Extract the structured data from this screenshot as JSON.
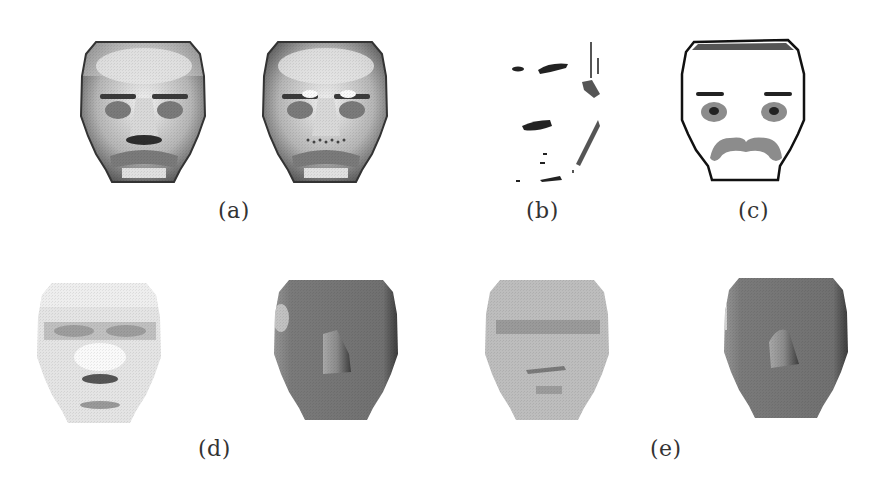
{
  "figure": {
    "panels": [
      {
        "id": "a",
        "label": "(a)",
        "description": "Two shaded face renderings; right one has bright spots over eyes and dotted nostril region"
      },
      {
        "id": "b",
        "label": "(b)",
        "description": "Sparse dark edge marks of a face"
      },
      {
        "id": "c",
        "label": "(c)",
        "description": "Line-drawing face outline with eyebrows, eyes and moustache"
      },
      {
        "id": "d",
        "label": "(d)",
        "description": "Pale face image and dark gray shaded face with nose"
      },
      {
        "id": "e",
        "label": "(e)",
        "description": "Light gray face image and dark gray shaded face with nose"
      }
    ]
  },
  "colors": {
    "background": "#ffffff",
    "label_text": "#333333",
    "face_light": "#e8e8e8",
    "face_mid": "#8a8a8a",
    "face_dark": "#3a3a3a",
    "outline": "#1a1a1a",
    "feature_gray": "#8c8c8c"
  }
}
